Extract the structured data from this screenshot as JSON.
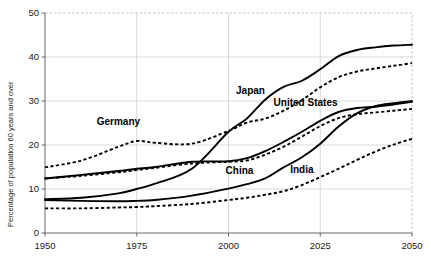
{
  "chart_data": {
    "type": "line",
    "title": "",
    "xlabel": "",
    "ylabel": "Percentage of population 60 years and over",
    "xlim": [
      1950,
      2050
    ],
    "ylim": [
      0,
      50
    ],
    "xticks": [
      1950,
      1975,
      2000,
      2025,
      2050
    ],
    "yticks": [
      0,
      10,
      20,
      30,
      40,
      50
    ],
    "grid": true,
    "legend": "inline-labels",
    "x": [
      1950,
      1960,
      1970,
      1975,
      1980,
      1990,
      2000,
      2005,
      2010,
      2015,
      2020,
      2025,
      2030,
      2035,
      2040,
      2045,
      2050
    ],
    "series": [
      {
        "name": "Japan",
        "style": "solid",
        "label": "Japan",
        "label_x": 2006,
        "label_y": 31.5,
        "values": [
          7.7,
          8.0,
          9.0,
          10.0,
          11.2,
          14.6,
          23.0,
          26.0,
          30.3,
          33.2,
          34.6,
          37.2,
          40.2,
          41.6,
          42.2,
          42.6,
          42.8
        ]
      },
      {
        "name": "Germany",
        "style": "dashed",
        "label": "Germany",
        "label_x": 1970,
        "label_y": 24.5,
        "values": [
          14.9,
          16.5,
          19.6,
          20.9,
          20.5,
          20.3,
          23.2,
          25.1,
          26.0,
          27.8,
          30.2,
          33.1,
          35.4,
          36.7,
          37.4,
          38.0,
          38.6
        ]
      },
      {
        "name": "United States",
        "style": "solid",
        "label": "United States",
        "label_x": 2021,
        "label_y": 28.8,
        "values": [
          12.4,
          13.2,
          14.1,
          14.6,
          15.0,
          16.2,
          16.3,
          17.0,
          18.6,
          20.7,
          23.0,
          25.5,
          27.5,
          28.4,
          28.7,
          29.2,
          29.8
        ]
      },
      {
        "name": "United States (dashed)",
        "style": "dashed",
        "label": "",
        "label_x": null,
        "label_y": null,
        "values": [
          12.4,
          13.0,
          13.8,
          14.3,
          14.8,
          15.8,
          16.2,
          16.5,
          17.8,
          19.6,
          21.9,
          24.3,
          26.1,
          27.0,
          27.4,
          27.8,
          28.2
        ]
      },
      {
        "name": "China",
        "style": "solid",
        "label": "China",
        "label_x": 2003,
        "label_y": 13.5,
        "values": [
          7.5,
          7.3,
          7.2,
          7.3,
          7.5,
          8.5,
          10.1,
          11.1,
          12.4,
          14.9,
          17.2,
          20.3,
          24.2,
          27.2,
          28.8,
          29.5,
          30.0
        ]
      },
      {
        "name": "India",
        "style": "dashed",
        "label": "India",
        "label_x": 2020,
        "label_y": 13.7,
        "values": [
          5.6,
          5.6,
          5.8,
          5.9,
          6.1,
          6.6,
          7.5,
          8.0,
          8.7,
          9.5,
          10.9,
          12.7,
          14.6,
          16.6,
          18.5,
          20.1,
          21.4
        ]
      }
    ]
  },
  "axis": {
    "y_label": "Percentage of population 60 years and over",
    "y_tick_labels": [
      "0",
      "10",
      "20",
      "30",
      "40",
      "50"
    ],
    "x_tick_labels": [
      "1950",
      "1975",
      "2000",
      "2025",
      "2050"
    ]
  },
  "colors": {
    "line": "#000000",
    "grid": "#c9c9c9",
    "frame": "#b3b3b3",
    "axis": "#555555",
    "text": "#1a1a1a",
    "background": "#ffffff"
  }
}
